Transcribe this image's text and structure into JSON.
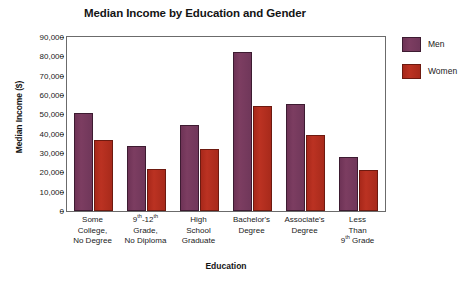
{
  "chart_data": {
    "type": "bar",
    "title": "Median Income by Education and Gender",
    "xlabel": "Education",
    "ylabel": "Median Income ($)",
    "ylim": [
      0,
      90000
    ],
    "ytick_labels": [
      "90,000",
      "80,000",
      "70,000",
      "60,000",
      "50,000",
      "40,000",
      "30,000",
      "20,000",
      "10,000",
      "0"
    ],
    "ytick_values": [
      90000,
      80000,
      70000,
      60000,
      50000,
      40000,
      30000,
      20000,
      10000,
      0
    ],
    "grid": false,
    "legend_position": "right",
    "categories": [
      "Some College, No Degree",
      "9th-12th Grade, No Diploma",
      "High School Graduate",
      "Bachelor's Degree",
      "Associate's Degree",
      "Less Than 9th Grade"
    ],
    "category_lines": [
      [
        "Some",
        "College,",
        "No Degree"
      ],
      [
        "9<sup>th</sup>-12<sup>th</sup>",
        "Grade,",
        "No Diploma"
      ],
      [
        "High",
        "School",
        "Graduate"
      ],
      [
        "Bachelor's",
        "Degree"
      ],
      [
        "Associate's",
        "Degree"
      ],
      [
        "Less",
        "Than",
        "9<sup>th</sup> Grade"
      ]
    ],
    "series": [
      {
        "name": "Men",
        "color": "#7c3d61",
        "values": [
          50800,
          33500,
          44500,
          82000,
          55500,
          28000
        ]
      },
      {
        "name": "Women",
        "color": "#bb3222",
        "values": [
          36500,
          21500,
          32000,
          54500,
          39500,
          21000
        ]
      }
    ]
  },
  "legend": {
    "items": [
      {
        "label": "Men"
      },
      {
        "label": "Women"
      }
    ]
  }
}
